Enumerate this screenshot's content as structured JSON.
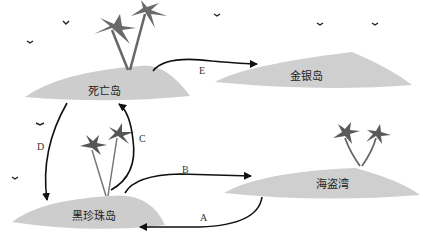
{
  "diagram": {
    "type": "island-route-map",
    "colors": {
      "island": "#cfcfcf",
      "island_shade": "#bdbdbd",
      "arrow": "#111111",
      "palm": "#555555",
      "background": "#ffffff"
    },
    "islands": [
      {
        "id": "death",
        "label": "死亡岛"
      },
      {
        "id": "gold",
        "label": "金银岛"
      },
      {
        "id": "black_pearl",
        "label": "黑珍珠岛"
      },
      {
        "id": "pirate_bay",
        "label": "海盗湾"
      }
    ],
    "edges": [
      {
        "label": "A",
        "from": "海盗湾",
        "to": "黑珍珠岛"
      },
      {
        "label": "B",
        "from": "黑珍珠岛",
        "to": "海盗湾"
      },
      {
        "label": "C",
        "from": "黑珍珠岛",
        "to": "死亡岛"
      },
      {
        "label": "D",
        "from": "死亡岛",
        "to": "黑珍珠岛"
      },
      {
        "label": "E",
        "from": "死亡岛",
        "to": "金银岛"
      }
    ]
  }
}
